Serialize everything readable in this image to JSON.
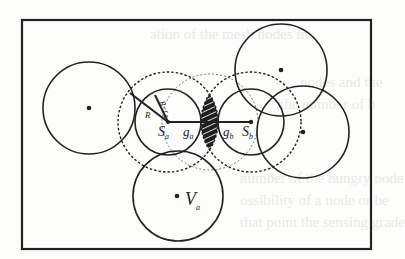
{
  "figure": {
    "colors": {
      "stroke": "#222222",
      "background": "#fdfdfb",
      "hatch_fill": "#1e1e1e"
    },
    "frame": {
      "x": 22,
      "y": 20,
      "width": 349,
      "height": 229
    }
  },
  "labels": {
    "radius_R": "R",
    "radius_diff": "R−r",
    "radius_diff_sub": "a",
    "sensor_a": "S",
    "sensor_a_sub": "a",
    "sensor_b": "S",
    "sensor_b_sub": "b",
    "gap_a": "g",
    "gap_a_sub": "a",
    "gap_b": "g",
    "gap_b_sub": "b",
    "node_v": "V",
    "node_v_sub": "a"
  },
  "circles": [
    {
      "id": "left",
      "cx": 89,
      "cy": 108,
      "r": 46,
      "style": "solid",
      "center_dot": true
    },
    {
      "id": "sa-inner",
      "cx": 168,
      "cy": 122,
      "r": 33,
      "style": "solid",
      "center_dot": false
    },
    {
      "id": "sa-outer",
      "cx": 168,
      "cy": 122,
      "r": 50,
      "style": "dashed",
      "center_dot": false
    },
    {
      "id": "mid-outer",
      "cx": 210,
      "cy": 122,
      "r": 48,
      "style": "dashed-light",
      "center_dot": false
    },
    {
      "id": "sb-inner",
      "cx": 251,
      "cy": 122,
      "r": 33,
      "style": "solid",
      "center_dot": false
    },
    {
      "id": "sb-outer",
      "cx": 251,
      "cy": 122,
      "r": 50,
      "style": "dashed",
      "center_dot": false
    },
    {
      "id": "top-right",
      "cx": 281,
      "cy": 70,
      "r": 46,
      "style": "solid",
      "center_dot": true
    },
    {
      "id": "right",
      "cx": 303,
      "cy": 132,
      "r": 46,
      "style": "solid",
      "center_dot": true
    },
    {
      "id": "bottom-va",
      "cx": 178,
      "cy": 196,
      "r": 45,
      "style": "solid",
      "center_dot": true
    }
  ],
  "background_text": [
    "ation of the mesh nodes in",
    "nodes and the",
    "the number of b",
    "number of the hungry node",
    "ossibility of a node or be",
    "that point the sensing grade"
  ]
}
